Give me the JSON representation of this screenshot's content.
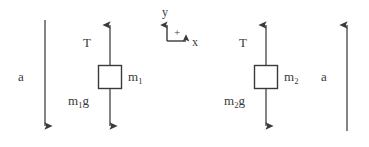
{
  "diagram": {
    "background_color": "#ffffff",
    "stroke_color": "#3a3a3a",
    "text_color": "#3a3a3a"
  },
  "axes": {
    "y_label": "y",
    "x_label": "x",
    "plus_label": "+",
    "origin": {
      "x": 167,
      "y": 41
    },
    "y_tip": {
      "x": 167,
      "y": 20
    },
    "x_tip": {
      "x": 190,
      "y": 41
    }
  },
  "left_acceleration": {
    "label": "a",
    "direction": "down",
    "arrow_top": {
      "x": 45,
      "y": 20
    },
    "arrow_bottom": {
      "x": 45,
      "y": 131
    }
  },
  "right_acceleration": {
    "label": "a",
    "direction": "up",
    "arrow_top": {
      "x": 347,
      "y": 20
    },
    "arrow_bottom": {
      "x": 347,
      "y": 131
    }
  },
  "body_one": {
    "mass_label": "m",
    "mass_subscript": "1",
    "tension_label": "T",
    "weight_label": "m",
    "weight_subscript": "1",
    "weight_suffix": "g",
    "center": {
      "x": 110,
      "y": 77
    },
    "block_width": 23,
    "block_height": 23,
    "tension_arrow_tip": {
      "x": 110,
      "y": 20
    },
    "weight_arrow_tip": {
      "x": 110,
      "y": 131
    }
  },
  "body_two": {
    "mass_label": "m",
    "mass_subscript": "2",
    "tension_label": "T",
    "weight_label": "m",
    "weight_subscript": "2",
    "weight_suffix": "g",
    "center": {
      "x": 266,
      "y": 77
    },
    "block_width": 23,
    "block_height": 23,
    "tension_arrow_tip": {
      "x": 266,
      "y": 20
    },
    "weight_arrow_tip": {
      "x": 266,
      "y": 131
    }
  }
}
